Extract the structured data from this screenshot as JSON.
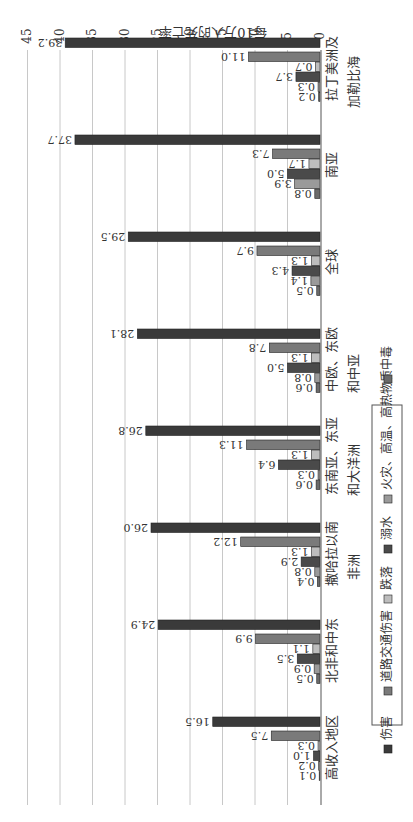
{
  "chart_data": {
    "type": "bar",
    "orientation": "vertical-bars, figure rotated 90deg clockwise",
    "title": "",
    "xlabel": "",
    "ylabel": "每10万人的死亡率",
    "ylim": [
      0,
      45
    ],
    "yticks": [
      0,
      5,
      10,
      15,
      20,
      25,
      30,
      35,
      40,
      45
    ],
    "grid": true,
    "legend_position": "bottom",
    "categories": [
      "拉丁美洲及\n加勒比海",
      "南亚",
      "全球",
      "中欧、东欧\n和中亚",
      "东南亚、东亚\n和大洋洲",
      "撒哈拉以南\n非洲",
      "北非和中东",
      "高收入地区"
    ],
    "series": [
      {
        "name": "伤害",
        "color": "#3a3a3a",
        "values": [
          39.2,
          37.7,
          29.5,
          28.1,
          26.8,
          26.0,
          24.9,
          16.5
        ]
      },
      {
        "name": "道路交通伤害",
        "color": "#7a7a7a",
        "values": [
          11.0,
          7.3,
          9.7,
          7.8,
          11.3,
          12.2,
          9.9,
          7.5
        ]
      },
      {
        "name": "跌落",
        "color": "#bdbdbd",
        "values": [
          0.7,
          1.7,
          1.3,
          1.3,
          1.3,
          1.3,
          1.1,
          0.3
        ]
      },
      {
        "name": "溺水",
        "color": "#4a4a4a",
        "values": [
          3.7,
          5.0,
          4.3,
          5.0,
          6.4,
          2.9,
          3.5,
          1.0
        ]
      },
      {
        "name": "火灾、高温、高热物质",
        "color": "#9a9a9a",
        "values": [
          0.3,
          3.9,
          1.4,
          0.8,
          0.3,
          0.8,
          0.9,
          0.2
        ]
      },
      {
        "name": "中毒",
        "color": "#6a6a6a",
        "values": [
          0.2,
          0.8,
          0.5,
          0.6,
          0.6,
          0.4,
          0.5,
          0.1
        ]
      }
    ]
  },
  "legend": {
    "items": [
      {
        "label": "伤害"
      },
      {
        "label": "道路交通伤害"
      },
      {
        "label": "跌落"
      },
      {
        "label": "溺水"
      },
      {
        "label": "火灾、高温、高热物质"
      },
      {
        "label": "中毒"
      }
    ]
  },
  "axis": {
    "ylabel": "每10万人的死亡率"
  }
}
